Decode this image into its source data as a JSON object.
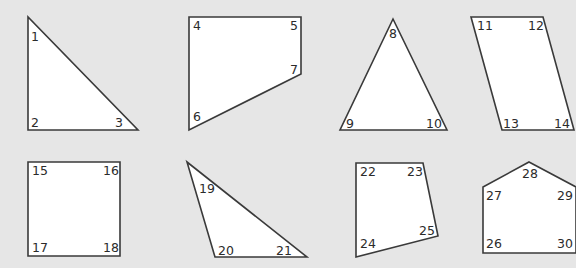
{
  "diagram": {
    "background": "#e6e6e6",
    "fill": "#ffffff",
    "stroke": "#3a3a3a",
    "shapes": [
      {
        "name": "right-triangle",
        "points": "28,17 28,130 138,130",
        "labels": [
          {
            "text": "1",
            "x": 31,
            "y": 41
          },
          {
            "text": "2",
            "x": 31,
            "y": 127
          },
          {
            "text": "3",
            "x": 115,
            "y": 127
          }
        ]
      },
      {
        "name": "trapezoid-quadrilateral",
        "points": "189,17 301,17 301,74 189,130",
        "labels": [
          {
            "text": "4",
            "x": 193,
            "y": 30
          },
          {
            "text": "5",
            "x": 290,
            "y": 30
          },
          {
            "text": "7",
            "x": 290,
            "y": 74
          },
          {
            "text": "6",
            "x": 193,
            "y": 121
          }
        ]
      },
      {
        "name": "isosceles-triangle",
        "points": "393,19 340,130 447,130",
        "labels": [
          {
            "text": "8",
            "x": 389,
            "y": 38
          },
          {
            "text": "9",
            "x": 346,
            "y": 128
          },
          {
            "text": "10",
            "x": 426,
            "y": 128
          }
        ]
      },
      {
        "name": "parallelogram",
        "points": "471,17 543,17 574,130 502,130",
        "labels": [
          {
            "text": "11",
            "x": 477,
            "y": 30
          },
          {
            "text": "12",
            "x": 528,
            "y": 30
          },
          {
            "text": "13",
            "x": 503,
            "y": 128
          },
          {
            "text": "14",
            "x": 554,
            "y": 128
          }
        ]
      },
      {
        "name": "square",
        "points": "28,162 120,162 120,256 28,256",
        "labels": [
          {
            "text": "15",
            "x": 32,
            "y": 175
          },
          {
            "text": "16",
            "x": 103,
            "y": 175
          },
          {
            "text": "17",
            "x": 32,
            "y": 252
          },
          {
            "text": "18",
            "x": 103,
            "y": 252
          }
        ]
      },
      {
        "name": "scalene-triangle",
        "points": "187,162 307,257 215,257",
        "labels": [
          {
            "text": "19",
            "x": 199,
            "y": 193
          },
          {
            "text": "20",
            "x": 218,
            "y": 255
          },
          {
            "text": "21",
            "x": 276,
            "y": 255
          }
        ]
      },
      {
        "name": "irregular-quadrilateral",
        "points": "356,163 423,163 438,236 356,257",
        "labels": [
          {
            "text": "22",
            "x": 360,
            "y": 176
          },
          {
            "text": "23",
            "x": 407,
            "y": 176
          },
          {
            "text": "25",
            "x": 419,
            "y": 235
          },
          {
            "text": "24",
            "x": 360,
            "y": 248
          }
        ]
      },
      {
        "name": "pentagon-house",
        "points": "529,162 576,187 576,253 483,253 483,187",
        "labels": [
          {
            "text": "28",
            "x": 522,
            "y": 178
          },
          {
            "text": "27",
            "x": 486,
            "y": 200
          },
          {
            "text": "29",
            "x": 557,
            "y": 200
          },
          {
            "text": "26",
            "x": 486,
            "y": 248
          },
          {
            "text": "30",
            "x": 557,
            "y": 248
          }
        ]
      }
    ]
  }
}
